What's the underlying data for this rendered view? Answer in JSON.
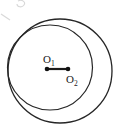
{
  "figure": {
    "background_color": "#ffffff",
    "stroke_color": "#262626",
    "width": 132,
    "height": 138
  },
  "chart_data": {
    "type": "diagram",
    "shapes": [
      {
        "name": "large-circle",
        "kind": "circle",
        "cx": 60,
        "cy": 71,
        "r": 52,
        "stroke_width": 1.3
      },
      {
        "name": "small-circle",
        "kind": "circle",
        "cx": 50,
        "cy": 67.5,
        "r": 42.5,
        "stroke_width": 1.2
      },
      {
        "name": "center-segment",
        "kind": "segment",
        "x1": 47,
        "y1": 69,
        "x2": 68,
        "y2": 69,
        "stroke_width": 2.2
      }
    ],
    "points": [
      {
        "name": "O1",
        "label": "O",
        "subscript": "1",
        "x": 47,
        "y": 69,
        "label_x": 43,
        "label_y": 63
      },
      {
        "name": "O2",
        "label": "O",
        "subscript": "2",
        "x": 68,
        "y": 69,
        "label_x": 66,
        "label_y": 83
      }
    ],
    "annotations": [
      "The two circles are internally tangent near the left side.",
      "Segment O1O2 joins the two centers horizontally."
    ]
  },
  "labels": {
    "o1_letter": "O",
    "o1_subscript": "1",
    "o2_letter": "O",
    "o2_subscript": "2"
  }
}
